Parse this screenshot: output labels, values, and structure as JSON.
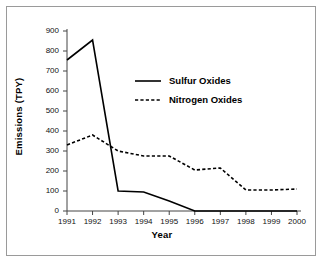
{
  "chart_data": {
    "type": "line",
    "title": "",
    "xlabel": "Year",
    "ylabel": "Emissions (TPY)",
    "x": [
      1991,
      1992,
      1993,
      1994,
      1995,
      1996,
      1997,
      1998,
      1999,
      2000
    ],
    "xtick_labels": [
      "1991",
      "1992",
      "1993",
      "1994",
      "1995",
      "1996",
      "1997",
      "1998",
      "1999",
      "2000"
    ],
    "ytick_labels": [
      "0",
      "100",
      "200",
      "300",
      "400",
      "500",
      "600",
      "700",
      "800",
      "900"
    ],
    "ytick_values": [
      0,
      100,
      200,
      300,
      400,
      500,
      600,
      700,
      800,
      900
    ],
    "ylim": [
      0,
      900
    ],
    "grid": false,
    "legend_position": "upper-center",
    "series": [
      {
        "name": "Sulfur Oxides",
        "style": "solid",
        "color": "#000000",
        "values": [
          755,
          855,
          100,
          95,
          50,
          0,
          0,
          0,
          0,
          0
        ]
      },
      {
        "name": "Nitrogen Oxides",
        "style": "dashed",
        "color": "#000000",
        "values": [
          330,
          380,
          300,
          275,
          275,
          205,
          215,
          105,
          105,
          110
        ]
      }
    ]
  },
  "legend": {
    "items": [
      {
        "label": "Sulfur Oxides",
        "style": "solid"
      },
      {
        "label": "Nitrogen Oxides",
        "style": "dashed"
      }
    ]
  },
  "axes": {
    "x_title": "Year",
    "y_title": "Emissions (TPY)"
  },
  "colors": {
    "ink": "#000000",
    "border": "#9a9a9a",
    "background": "#ffffff"
  }
}
